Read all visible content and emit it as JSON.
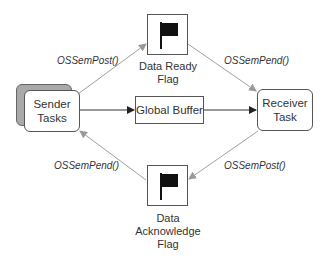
{
  "diagram": {
    "nodes": {
      "sender": {
        "label_line1": "Sender",
        "label_line2": "Tasks"
      },
      "receiver": {
        "label_line1": "Receiver",
        "label_line2": "Task"
      },
      "buffer": {
        "label": "Global Buffer"
      },
      "ready_flag": {
        "label_line1": "Data Ready",
        "label_line2": "Flag",
        "icon": "flag-icon"
      },
      "ack_flag": {
        "label_line1": "Data",
        "label_line2": "Acknowledge",
        "label_line3": "Flag",
        "icon": "flag-icon"
      }
    },
    "edges": {
      "sender_to_ready": "OSSemPost()",
      "ready_to_receiver": "OSSemPend()",
      "ack_to_sender": "OSSemPend()",
      "receiver_to_ack": "OSSemPost()"
    },
    "colors": {
      "line_dark": "#333333",
      "line_gray": "#a0a0a0",
      "shadow": "#a9a9a9",
      "flag": "#111111"
    }
  }
}
